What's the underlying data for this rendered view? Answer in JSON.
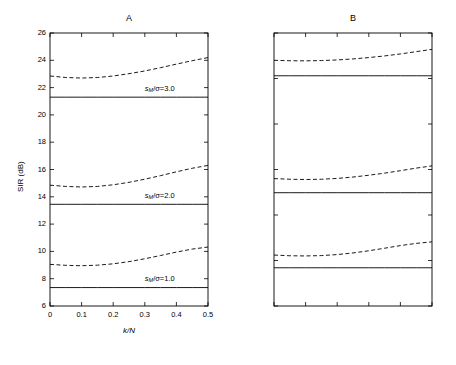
{
  "figure": {
    "width": 456,
    "height": 365,
    "background": "#ffffff",
    "line_color": "#000000"
  },
  "chart_data": [
    {
      "type": "line",
      "panel_id": "A",
      "title": "A",
      "xlabel": "k/N",
      "ylabel": "SIR  (dB)",
      "xlim": [
        0,
        0.5
      ],
      "ylim": [
        6,
        26
      ],
      "xticks": [
        0,
        0.1,
        0.2,
        0.3,
        0.4,
        0.5
      ],
      "xticklabels": [
        "0",
        "0.1",
        "0.2",
        "0.3",
        "0.4",
        "0.5"
      ],
      "yticks": [
        6,
        8,
        10,
        12,
        14,
        16,
        18,
        20,
        22,
        24,
        26
      ],
      "yticklabels": [
        "6",
        "8",
        "10",
        "12",
        "14",
        "16",
        "18",
        "20",
        "22",
        "24",
        "26"
      ],
      "grid": false,
      "legend": "inline-annotations",
      "x": [
        0,
        0.05,
        0.1,
        0.15,
        0.2,
        0.25,
        0.3,
        0.35,
        0.4,
        0.45,
        0.5
      ],
      "series": [
        {
          "name": "sM/sigma=3.0 (solid)",
          "style": "solid",
          "values": [
            21.3,
            21.3,
            21.3,
            21.3,
            21.3,
            21.3,
            21.3,
            21.3,
            21.3,
            21.3,
            21.3
          ]
        },
        {
          "name": "sM/sigma=3.0 (dashed)",
          "style": "dashed",
          "values": [
            22.85,
            22.74,
            22.7,
            22.74,
            22.85,
            23.02,
            23.22,
            23.46,
            23.72,
            23.97,
            24.2
          ]
        },
        {
          "name": "sM/sigma=2.0 (solid)",
          "style": "solid",
          "values": [
            13.45,
            13.45,
            13.45,
            13.45,
            13.45,
            13.45,
            13.45,
            13.45,
            13.45,
            13.45,
            13.45
          ]
        },
        {
          "name": "sM/sigma=2.0 (dashed)",
          "style": "dashed",
          "values": [
            14.85,
            14.76,
            14.72,
            14.76,
            14.88,
            15.06,
            15.29,
            15.55,
            15.83,
            16.09,
            16.3
          ]
        },
        {
          "name": "sM/sigma=1.0 (solid)",
          "style": "solid",
          "values": [
            7.35,
            7.35,
            7.35,
            7.35,
            7.35,
            7.35,
            7.35,
            7.35,
            7.35,
            7.35,
            7.35
          ]
        },
        {
          "name": "sM/sigma=1.0 (dashed)",
          "style": "dashed",
          "values": [
            9.05,
            8.98,
            8.95,
            8.99,
            9.09,
            9.25,
            9.46,
            9.7,
            9.95,
            10.17,
            10.32
          ]
        }
      ],
      "annotations": [
        {
          "text_prefix": "s",
          "text_sub": "M",
          "text_suffix": "/σ=3.0",
          "x": 0.3,
          "y": 21.9
        },
        {
          "text_prefix": "s",
          "text_sub": "M",
          "text_suffix": "/σ=2.0",
          "x": 0.3,
          "y": 14.05
        },
        {
          "text_prefix": "s",
          "text_sub": "M",
          "text_suffix": "/σ=1.0",
          "x": 0.3,
          "y": 7.95
        }
      ]
    },
    {
      "type": "line",
      "panel_id": "B",
      "title": "B",
      "xlabel": "k/N",
      "ylabel": "SIR  (dB)",
      "xlim": [
        0,
        0.5
      ],
      "ylim": [
        5,
        35
      ],
      "xticks": [
        0,
        0.1,
        0.2,
        0.3,
        0.4,
        0.5
      ],
      "xticklabels": [
        "0",
        "0.1",
        "0.2",
        "0.3",
        "0.4",
        "0.5"
      ],
      "yticks": [
        5,
        10,
        15,
        20,
        25,
        30,
        35
      ],
      "yticklabels": [
        "5",
        "10",
        "15",
        "20",
        "25",
        "30",
        "35"
      ],
      "grid": false,
      "legend": "inline-annotations",
      "x": [
        0,
        0.05,
        0.1,
        0.15,
        0.2,
        0.25,
        0.3,
        0.35,
        0.4,
        0.45,
        0.5
      ],
      "series": [
        {
          "name": "sM/sigma=3.0 (solid)",
          "style": "solid",
          "values": [
            30.3,
            30.3,
            30.3,
            30.3,
            30.3,
            30.3,
            30.3,
            30.3,
            30.3,
            30.3,
            30.3
          ]
        },
        {
          "name": "sM/sigma=3.0 (dashed)",
          "style": "dashed",
          "values": [
            32.0,
            31.95,
            31.94,
            31.97,
            32.04,
            32.15,
            32.3,
            32.48,
            32.7,
            32.95,
            33.2
          ]
        },
        {
          "name": "sM/sigma=2.0 (solid)",
          "style": "solid",
          "values": [
            17.45,
            17.45,
            17.45,
            17.45,
            17.45,
            17.45,
            17.45,
            17.45,
            17.45,
            17.45,
            17.45
          ]
        },
        {
          "name": "sM/sigma=2.0 (dashed)",
          "style": "dashed",
          "values": [
            19.0,
            18.93,
            18.9,
            18.93,
            19.02,
            19.17,
            19.37,
            19.6,
            19.87,
            20.15,
            20.4
          ]
        },
        {
          "name": "sM/sigma=1.0 (solid)",
          "style": "solid",
          "values": [
            9.2,
            9.2,
            9.2,
            9.2,
            9.2,
            9.2,
            9.2,
            9.2,
            9.2,
            9.2,
            9.2
          ]
        },
        {
          "name": "sM/sigma=1.0 (dashed)",
          "style": "dashed",
          "values": [
            10.6,
            10.52,
            10.5,
            10.54,
            10.65,
            10.83,
            11.07,
            11.35,
            11.64,
            11.88,
            12.05
          ]
        }
      ],
      "annotations": [
        {
          "text_prefix": "s",
          "text_sub": "M",
          "text_suffix": "/σ=3.0",
          "x": 0.3,
          "y": 31.0
        },
        {
          "text_prefix": "s",
          "text_sub": "M",
          "text_suffix": "/σ=2.0",
          "x": 0.3,
          "y": 18.3
        },
        {
          "text_prefix": "s",
          "text_sub": "M",
          "text_suffix": "/σ=1.0",
          "x": 0.3,
          "y": 10.0
        }
      ]
    }
  ]
}
